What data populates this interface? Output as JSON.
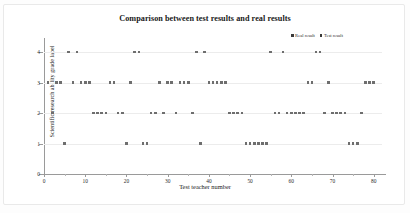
{
  "chart_data": {
    "type": "scatter",
    "title": "Comparison between test results and real results",
    "xlabel": "Test teacher number",
    "ylabel": "Scientific research ability grade label",
    "xlim": [
      0,
      82
    ],
    "ylim": [
      0,
      4.4
    ],
    "xticks": [
      0,
      10,
      20,
      30,
      40,
      50,
      60,
      70,
      80
    ],
    "yticks": [
      0,
      1,
      2,
      3,
      4
    ],
    "grid": true,
    "legend_position": "top-right",
    "legend": [
      "Real result",
      "Test result"
    ],
    "x": [
      1,
      2,
      3,
      4,
      5,
      6,
      7,
      8,
      9,
      10,
      11,
      12,
      13,
      14,
      15,
      16,
      17,
      18,
      19,
      20,
      21,
      22,
      23,
      24,
      25,
      26,
      27,
      28,
      29,
      30,
      31,
      32,
      33,
      34,
      35,
      36,
      37,
      38,
      39,
      40,
      41,
      42,
      43,
      44,
      45,
      46,
      47,
      48,
      49,
      50,
      51,
      52,
      53,
      54,
      55,
      56,
      57,
      58,
      59,
      60,
      61,
      62,
      63,
      64,
      65,
      66,
      67,
      68,
      69,
      70,
      71,
      72,
      73,
      74,
      75,
      76,
      77,
      78,
      79,
      80
    ],
    "series": [
      {
        "name": "Real result",
        "color": "#4a4a4a",
        "values": [
          3,
          2,
          3,
          3,
          1,
          4,
          3,
          4,
          3,
          3,
          3,
          2,
          2,
          2,
          2,
          3,
          3,
          2,
          2,
          1,
          3,
          4,
          4,
          1,
          1,
          2,
          2,
          3,
          2,
          3,
          3,
          2,
          3,
          3,
          3,
          2,
          4,
          1,
          4,
          3,
          3,
          3,
          3,
          3,
          2,
          2,
          2,
          2,
          1,
          1,
          1,
          1,
          1,
          1,
          4,
          2,
          2,
          4,
          2,
          2,
          2,
          2,
          2,
          3,
          3,
          4,
          4,
          2,
          3,
          2,
          2,
          2,
          2,
          1,
          1,
          1,
          2,
          3,
          3,
          3
        ]
      },
      {
        "name": "Test result",
        "color": "#6e6e6e",
        "values": [
          3,
          2,
          3,
          3,
          1,
          4,
          3,
          4,
          3,
          3,
          3,
          2,
          2,
          2,
          2,
          3,
          3,
          2,
          2,
          1,
          3,
          4,
          4,
          1,
          1,
          2,
          2,
          3,
          2,
          3,
          3,
          2,
          3,
          3,
          3,
          2,
          4,
          1,
          4,
          3,
          3,
          3,
          3,
          3,
          2,
          2,
          2,
          2,
          1,
          1,
          1,
          1,
          1,
          1,
          4,
          2,
          2,
          4,
          2,
          2,
          2,
          2,
          2,
          3,
          3,
          4,
          4,
          2,
          3,
          2,
          2,
          2,
          2,
          1,
          1,
          1,
          2,
          3,
          3,
          3
        ]
      }
    ]
  }
}
